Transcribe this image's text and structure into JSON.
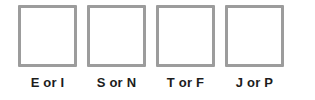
{
  "widget": {
    "name": "MBTI type entry boxes",
    "background_color": "#ffffff",
    "box_border_color": "#9c9c9c",
    "box_fill_color": "#ffffff",
    "label_color": "#1c1c1c"
  },
  "dichotomies": [
    {
      "label": "E or I",
      "value": "",
      "placeholder": ""
    },
    {
      "label": "S or N",
      "value": "",
      "placeholder": ""
    },
    {
      "label": "T or F",
      "value": "",
      "placeholder": ""
    },
    {
      "label": "J or P",
      "value": "",
      "placeholder": ""
    }
  ]
}
